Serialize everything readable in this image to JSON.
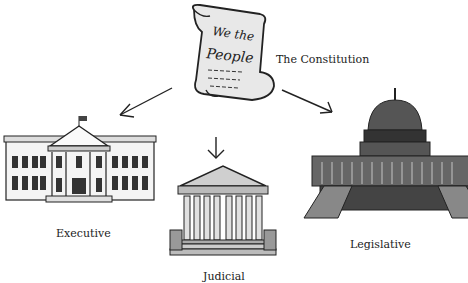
{
  "diagram": {
    "root": {
      "label": "The Constitution",
      "scroll_text_line1": "We the",
      "scroll_text_line2": "People",
      "icon": "scroll-icon"
    },
    "branches": [
      {
        "label": "Executive",
        "icon": "white-house-icon"
      },
      {
        "label": "Judicial",
        "icon": "supreme-court-icon"
      },
      {
        "label": "Legislative",
        "icon": "capitol-building-icon"
      }
    ],
    "edges": [
      {
        "from": "The Constitution",
        "to": "Executive"
      },
      {
        "from": "The Constitution",
        "to": "Judicial"
      },
      {
        "from": "The Constitution",
        "to": "Legislative"
      }
    ]
  }
}
